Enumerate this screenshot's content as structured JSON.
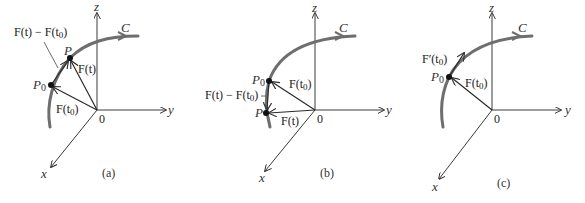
{
  "figure": {
    "panels": [
      {
        "id": "a",
        "caption": "(a)",
        "axes": {
          "x": "x",
          "y": "y",
          "z": "z",
          "origin": "0"
        },
        "curve_label": "C",
        "points": {
          "p0": "P0_label",
          "p": "P"
        },
        "vectors": [
          "F(t0)",
          "F(t)",
          "F(t) − F(t0)"
        ],
        "labels": {
          "p": "P",
          "p0_main": "P",
          "p0_sub": "0",
          "ft": "F(t)",
          "ft0_main": "F(t",
          "ft0_sub": "0",
          "ft0_close": ")",
          "diff_main": "F(t) − F(t",
          "diff_sub": "0",
          "diff_close": ")"
        }
      },
      {
        "id": "b",
        "caption": "(b)",
        "axes": {
          "x": "x",
          "y": "y",
          "z": "z",
          "origin": "0"
        },
        "curve_label": "C",
        "labels": {
          "p": "P",
          "p0_main": "P",
          "p0_sub": "0",
          "ft": "F(t)",
          "ft0_main": "F(t",
          "ft0_sub": "0",
          "ft0_close": ")",
          "diff_main": "F(t) − F(t",
          "diff_sub": "0",
          "diff_close": ")"
        }
      },
      {
        "id": "c",
        "caption": "(c)",
        "axes": {
          "x": "x",
          "y": "y",
          "z": "z",
          "origin": "0"
        },
        "curve_label": "C",
        "labels": {
          "p0_main": "P",
          "p0_sub": "0",
          "ft0_main": "F(t",
          "ft0_sub": "0",
          "ft0_close": ")",
          "deriv_main": "F′(t",
          "deriv_sub": "0",
          "deriv_close": ")"
        }
      }
    ]
  }
}
